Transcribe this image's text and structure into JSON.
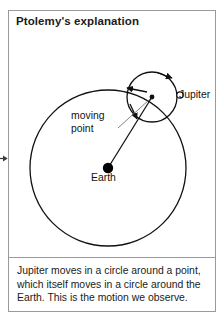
{
  "panel": {
    "title": "Ptolemy's explanation",
    "border_color": "#9a9a9a",
    "background": "#ffffff"
  },
  "diagram": {
    "type": "astronomical-epicycle-diagram",
    "stroke_color": "#111111",
    "labels": {
      "jupiter": "Jupiter",
      "earth": "Earth",
      "moving_point_line1": "moving",
      "moving_point_line2": "point"
    },
    "deferent": {
      "name": "large-circle",
      "center_x": 99,
      "center_y": 128,
      "radius": 78
    },
    "epicycle": {
      "name": "small-circle",
      "center_x": 143,
      "center_y": 57,
      "radius": 25
    },
    "earth_marker": {
      "center_x": 99,
      "center_y": 128,
      "radius": 5,
      "fill": "#000000"
    },
    "jupiter_marker": {
      "center_x": 171,
      "center_y": 55,
      "radius": 3.2,
      "fill": "#ffffff"
    },
    "moving_point_marker": {
      "center_x": 143,
      "center_y": 57,
      "radius": 2.4,
      "fill": "#000000"
    }
  },
  "caption": {
    "line1": "Jupiter moves in a circle around a point,",
    "line2": "which itself moves in a circle around the",
    "line3": "Earth. This is the motion we observe."
  }
}
